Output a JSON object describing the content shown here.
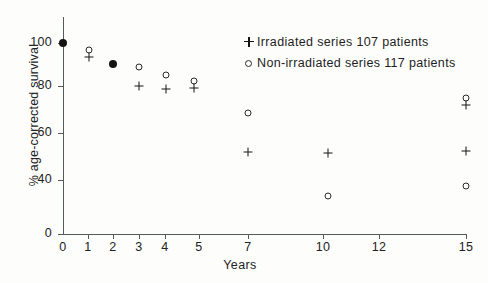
{
  "chart_data": {
    "type": "scatter",
    "title": "",
    "xlabel": "Years",
    "ylabel": "% age-corrected survival",
    "grid": false,
    "legend_position": "top-right",
    "x": [
      0,
      1,
      2,
      3,
      4,
      5,
      7,
      10,
      15
    ],
    "xtick_labels": [
      "0",
      "1",
      "2",
      "3",
      "4",
      "5",
      "7",
      "10",
      "12",
      "15"
    ],
    "xtick_values": [
      0,
      1,
      2,
      3,
      4,
      5,
      7,
      10,
      12,
      15
    ],
    "ytick_labels": [
      "0",
      "40",
      "60",
      "80",
      "100"
    ],
    "ytick_values": [
      0,
      40,
      60,
      80,
      100
    ],
    "ylim": [
      0,
      105
    ],
    "y_axis_break": true,
    "series": [
      {
        "name": "Irradiated series 107 patients",
        "marker": "plus",
        "n_patients": 107,
        "values": [
          100,
          92.5,
          90,
          80,
          78.5,
          78.5,
          61.5,
          60.5,
          62
        ]
      },
      {
        "name": "Non-irradiated series 117 patients",
        "marker": "open-circle",
        "n_patients": 117,
        "values": [
          100,
          94,
          90,
          89,
          85.5,
          80,
          67.5,
          45,
          48.5
        ]
      }
    ],
    "notes": [
      "At year 0 both series coincide at 100% and are drawn as a single filled dot.",
      "At year 2 both series coincide at 90% and are drawn as a single filled dot.",
      "At year 15 an additional combined circle-plus marker appears at 78%."
    ],
    "annotations": [
      {
        "x": 15,
        "y": 78,
        "marker": "circle-plus-combined"
      }
    ]
  },
  "legend": {
    "entries": [
      {
        "symbol": "plus-icon",
        "label": "Irradiated series 107 patients"
      },
      {
        "symbol": "open-circle-icon",
        "label": "Non-irradiated series 117 patients"
      }
    ]
  },
  "axes": {
    "x_title": "Years",
    "y_title": "% age-corrected survival",
    "y_ticks": [
      {
        "label": "100",
        "top": 43
      },
      {
        "label": "80",
        "top": 86
      },
      {
        "label": "60",
        "top": 133
      },
      {
        "label": "40",
        "top": 180
      },
      {
        "label": "0",
        "top": 234
      }
    ],
    "x_ticks": [
      {
        "label": "0",
        "left": 63
      },
      {
        "label": "1",
        "left": 88
      },
      {
        "label": "2",
        "left": 113
      },
      {
        "label": "3",
        "left": 139
      },
      {
        "label": "4",
        "left": 165
      },
      {
        "label": "5",
        "left": 199
      },
      {
        "label": "7",
        "left": 248
      },
      {
        "label": "10",
        "left": 323
      },
      {
        "label": "12",
        "left": 379
      },
      {
        "label": "15",
        "left": 466
      }
    ]
  },
  "points": [
    {
      "name": "point-year0-both-100",
      "kind": "filled",
      "left": 63,
      "top": 43
    },
    {
      "name": "point-year1-combo",
      "kind": "combo",
      "left": 89,
      "top": 54
    },
    {
      "name": "point-year2-both-90",
      "kind": "filled",
      "left": 113,
      "top": 64
    },
    {
      "name": "point-year3-nonirr-89",
      "kind": "open",
      "left": 139,
      "top": 67
    },
    {
      "name": "point-year3-irr-80",
      "kind": "plus",
      "left": 139,
      "top": 86
    },
    {
      "name": "point-year4-nonirr-85",
      "kind": "open",
      "left": 166,
      "top": 75
    },
    {
      "name": "point-year4-irr-78",
      "kind": "plus",
      "left": 166,
      "top": 89
    },
    {
      "name": "point-year5-combo",
      "kind": "combo",
      "left": 194,
      "top": 85
    },
    {
      "name": "point-year7-nonirr-67",
      "kind": "open",
      "left": 248,
      "top": 113
    },
    {
      "name": "point-year7-irr-61",
      "kind": "plus",
      "left": 248,
      "top": 152
    },
    {
      "name": "point-year10-irr-60",
      "kind": "plus",
      "left": 328,
      "top": 153
    },
    {
      "name": "point-year10-nonirr-45",
      "kind": "open",
      "left": 328,
      "top": 196
    },
    {
      "name": "point-year15-combo-78",
      "kind": "combo",
      "left": 466,
      "top": 102
    },
    {
      "name": "point-year15-irr-62",
      "kind": "plus",
      "left": 466,
      "top": 151
    },
    {
      "name": "point-year15-nonirr-48",
      "kind": "open",
      "left": 466,
      "top": 186
    }
  ]
}
